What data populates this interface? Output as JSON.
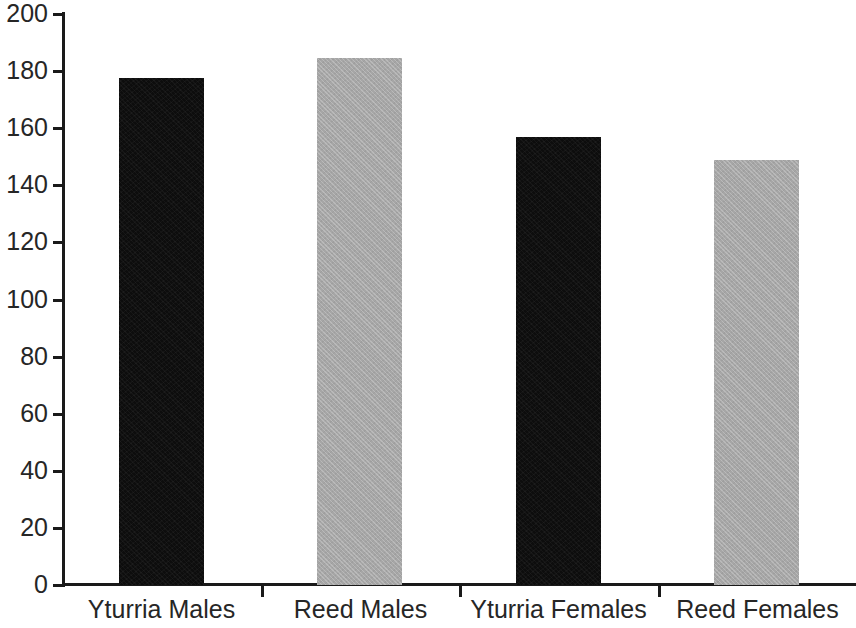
{
  "chart_data": {
    "type": "bar",
    "title": "",
    "subtitle": "",
    "xlabel": "",
    "ylabel": "",
    "categories": [
      "Yturria Males",
      "Reed Males",
      "Yturria Females",
      "Reed Females"
    ],
    "values": [
      177.5,
      184.5,
      157,
      149
    ],
    "series": [
      {
        "name": "",
        "values": [
          177.5,
          184.5,
          157,
          149
        ]
      }
    ],
    "bar_colors": [
      "#0d0d0d",
      "#a6a6a6",
      "#0d0d0d",
      "#a6a6a6"
    ],
    "ylim": [
      0,
      200
    ],
    "ytick_labels": [
      "0",
      "20",
      "40",
      "60",
      "80",
      "100",
      "120",
      "140",
      "160",
      "180",
      "200"
    ],
    "ytick_values": [
      0,
      20,
      40,
      60,
      80,
      100,
      120,
      140,
      160,
      180,
      200
    ],
    "grid": false,
    "legend": "none",
    "axis_color": "#1a1a1a",
    "text_color": "#262626",
    "background": "#ffffff"
  }
}
